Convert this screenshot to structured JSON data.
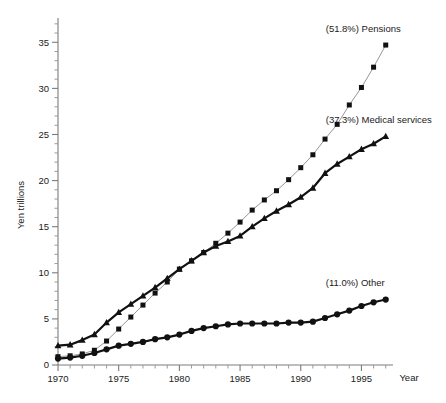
{
  "chart_data": {
    "type": "line",
    "title": "",
    "xlabel": "Year",
    "ylabel": "Yen trillions",
    "xlim": [
      1970,
      1997.6
    ],
    "ylim": [
      0,
      37.2
    ],
    "grid": false,
    "legend_position": "inline-right-end",
    "x_ticks_major": [
      1970,
      1975,
      1980,
      1985,
      1990,
      1995
    ],
    "x_tick_labels": [
      "1970",
      "1975",
      "1980",
      "1985",
      "1990",
      "1995"
    ],
    "x_tick_minor_step": 1,
    "y_ticks_major": [
      0,
      5,
      10,
      15,
      20,
      25,
      30,
      35
    ],
    "y_tick_labels": [
      "0",
      "5",
      "10",
      "15",
      "20",
      "25",
      "30",
      "35"
    ],
    "y_tick_minor_step": 1,
    "x": [
      1970,
      1971,
      1972,
      1973,
      1974,
      1975,
      1976,
      1977,
      1978,
      1979,
      1980,
      1981,
      1982,
      1983,
      1984,
      1985,
      1986,
      1987,
      1988,
      1989,
      1990,
      1991,
      1992,
      1993,
      1994,
      1995,
      1996,
      1997
    ],
    "series": [
      {
        "name": "Pensions",
        "label": "(51.8%) Pensions",
        "percent": "51.8%",
        "marker": "square",
        "line_style": "thin",
        "color": "#111111",
        "line_color": "#8a8a8a",
        "values": [
          0.9,
          1.0,
          1.2,
          1.6,
          2.6,
          3.9,
          5.2,
          6.5,
          7.8,
          9.0,
          10.4,
          11.3,
          12.2,
          13.2,
          14.3,
          15.5,
          16.8,
          17.9,
          18.9,
          20.1,
          21.4,
          22.8,
          24.5,
          26.1,
          28.2,
          30.1,
          32.3,
          34.7
        ]
      },
      {
        "name": "Medical services",
        "label": "(37.3%) Medical services",
        "percent": "37.3%",
        "marker": "triangle",
        "line_style": "thick",
        "color": "#111111",
        "line_color": "#111111",
        "values": [
          2.1,
          2.2,
          2.7,
          3.3,
          4.6,
          5.7,
          6.6,
          7.5,
          8.4,
          9.4,
          10.4,
          11.3,
          12.2,
          12.9,
          13.4,
          14.0,
          15.0,
          15.9,
          16.7,
          17.4,
          18.2,
          19.2,
          20.8,
          21.8,
          22.6,
          23.4,
          24.0,
          24.8
        ]
      },
      {
        "name": "Other",
        "label": "(11.0%) Other",
        "percent": "11.0%",
        "marker": "circle",
        "line_style": "thick",
        "color": "#111111",
        "line_color": "#111111",
        "values": [
          0.7,
          0.8,
          1.0,
          1.3,
          1.7,
          2.1,
          2.3,
          2.5,
          2.8,
          3.0,
          3.3,
          3.7,
          4.0,
          4.2,
          4.4,
          4.5,
          4.5,
          4.5,
          4.5,
          4.6,
          4.6,
          4.7,
          5.1,
          5.5,
          5.9,
          6.4,
          6.8,
          7.1
        ]
      }
    ]
  },
  "axes": {
    "y_title": "Yen trillions",
    "x_title": "Year"
  }
}
